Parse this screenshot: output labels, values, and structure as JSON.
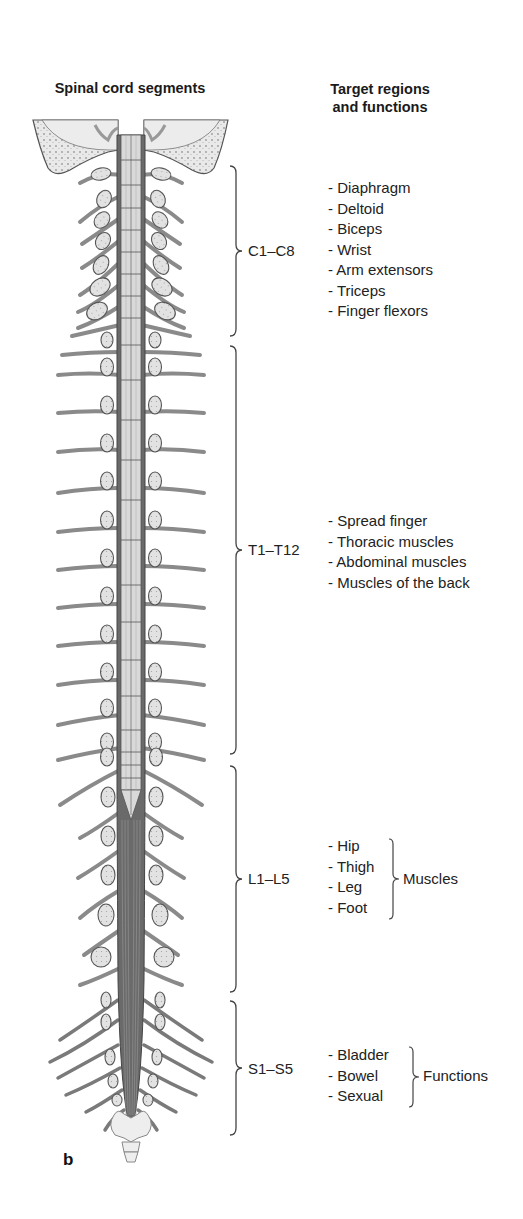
{
  "headers": {
    "left": "Spinal cord segments",
    "right_line1": "Target regions",
    "right_line2": "and functions"
  },
  "segments": [
    {
      "id": "cervical",
      "label": "C1–C8",
      "functions": [
        "- Diaphragm",
        "- Deltoid",
        "- Biceps",
        "- Wrist",
        "- Arm extensors",
        "- Triceps",
        "- Finger flexors"
      ]
    },
    {
      "id": "thoracic",
      "label": "T1–T12",
      "functions": [
        "- Spread finger",
        "- Thoracic muscles",
        "- Abdominal muscles",
        "- Muscles of the back"
      ]
    },
    {
      "id": "lumbar",
      "label": "L1–L5",
      "functions": [
        "- Hip",
        "- Thigh",
        "- Leg",
        "- Foot"
      ],
      "group_label": "Muscles"
    },
    {
      "id": "sacral",
      "label": "S1–S5",
      "functions": [
        "- Bladder",
        "- Bowel",
        "- Sexual"
      ],
      "group_label": "Functions"
    }
  ],
  "panel_letter": "b",
  "colors": {
    "nerve": "#8a8a8a",
    "nerve_dark": "#555555",
    "ganglion_fill": "#dcdcdc",
    "bone_fill": "#e8e8e8",
    "cord_fill": "#d9d9d9",
    "text": "#222222"
  }
}
